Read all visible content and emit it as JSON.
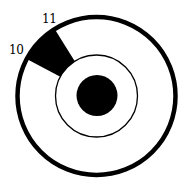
{
  "diagram": {
    "labels": {
      "start": "10",
      "end": "11"
    },
    "colors": {
      "stroke": "#000000",
      "fill": "#000000",
      "background": "#ffffff"
    },
    "geometry": {
      "center": [
        96.5,
        96
      ],
      "outer_radius": 79,
      "inner_radius": 41,
      "core_radius": 20.5,
      "sector_start_deg": 122,
      "sector_end_deg": 152
    }
  }
}
